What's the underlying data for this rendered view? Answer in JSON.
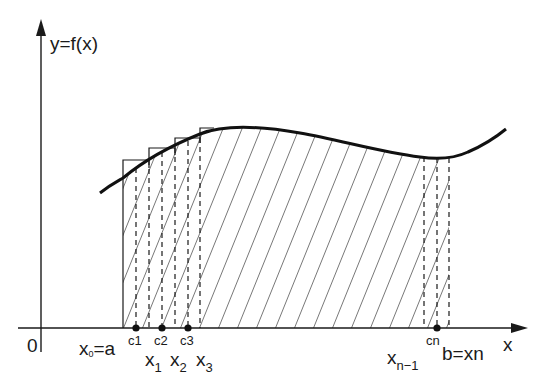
{
  "figure": {
    "y_axis_label": "y=f(x)",
    "x_axis_label": "x",
    "origin_label": "0",
    "colors": {
      "ink": "#1a1a1a",
      "background": "#ffffff"
    }
  },
  "labels": {
    "a": {
      "base": "x",
      "sub": "0",
      "rest": "=a"
    },
    "x1": {
      "base": "x",
      "sub": "1"
    },
    "x2": {
      "base": "x",
      "sub": "2"
    },
    "x3": {
      "base": "x",
      "sub": "3"
    },
    "xn1": {
      "base": "x",
      "sub": "n−1"
    },
    "b": "b=xn",
    "c1": "c1",
    "c2": "c2",
    "c3": "c3",
    "cn": "cn"
  },
  "geometry": {
    "partition_points": [
      "x0=a",
      "x1",
      "x2",
      "x3",
      "...",
      "x(n-1)",
      "b=xn"
    ],
    "sample_points": [
      "c1",
      "c2",
      "c3",
      "...",
      "cn"
    ],
    "shading": "diagonal hatching under curve from a to b"
  }
}
